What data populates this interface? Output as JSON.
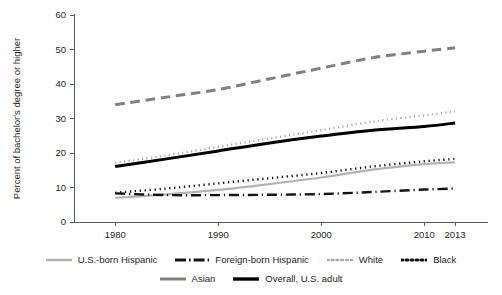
{
  "chart_data": {
    "type": "line",
    "title": "",
    "xlabel": "",
    "ylabel": "Percent of bachelor's degree or higher",
    "xlim": [
      1976,
      2016
    ],
    "ylim": [
      0,
      60
    ],
    "grid": false,
    "legend_position": "bottom",
    "x_ticks": [
      "1980",
      "1990",
      "2000",
      "2010",
      "2013"
    ],
    "x_tick_values": [
      1980,
      1990,
      2000,
      2010,
      2013
    ],
    "y_ticks": [
      "0",
      "10",
      "20",
      "30",
      "40",
      "50",
      "60"
    ],
    "y_tick_values": [
      0,
      10,
      20,
      30,
      40,
      50,
      60
    ],
    "x": [
      1980,
      1985,
      1990,
      1995,
      2000,
      2005,
      2010,
      2013
    ],
    "series": [
      {
        "name": "U.S.-born Hispanic",
        "color": "#b3b3b3",
        "style": "solid",
        "width": 2.2,
        "values": [
          7.0,
          8.0,
          9.3,
          11.0,
          12.9,
          15.2,
          16.8,
          17.3
        ]
      },
      {
        "name": "Foreign-born Hispanic",
        "color": "#141414",
        "style": "dashdot",
        "width": 2.4,
        "values": [
          8.3,
          7.8,
          7.8,
          7.9,
          8.1,
          8.7,
          9.4,
          9.7
        ]
      },
      {
        "name": "White",
        "color": "#a8a8a8",
        "style": "dotted",
        "width": 2.2,
        "values": [
          17.2,
          19.3,
          21.8,
          24.2,
          26.6,
          29.1,
          30.9,
          32.1
        ]
      },
      {
        "name": "Black",
        "color": "#141414",
        "style": "dotted",
        "width": 2.4,
        "values": [
          8.5,
          9.7,
          11.2,
          12.7,
          14.2,
          16.1,
          17.6,
          18.3
        ]
      },
      {
        "name": "Asian",
        "color": "#808080",
        "style": "dashed",
        "width": 3.0,
        "values": [
          34.0,
          36.2,
          38.4,
          41.5,
          44.6,
          47.6,
          49.5,
          50.5
        ]
      },
      {
        "name": "Overall, U.S. adult",
        "color": "#000000",
        "style": "solid",
        "width": 3.0,
        "values": [
          16.1,
          18.3,
          20.6,
          22.9,
          24.9,
          26.6,
          27.7,
          28.7
        ]
      }
    ]
  },
  "legend": {
    "rows": [
      [
        {
          "label": "U.S.-born Hispanic",
          "swatch": "line-swatch-solid-gray"
        },
        {
          "label": "Foreign-born Hispanic",
          "swatch": "line-swatch-dashdot-black"
        },
        {
          "label": "White",
          "swatch": "line-swatch-dotted-gray"
        },
        {
          "label": "Black",
          "swatch": "line-swatch-dotted-black"
        }
      ],
      [
        {
          "label": "Asian",
          "swatch": "line-swatch-solid-midgray"
        },
        {
          "label": "Overall, U.S. adult",
          "swatch": "line-swatch-solid-black"
        }
      ]
    ]
  }
}
